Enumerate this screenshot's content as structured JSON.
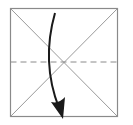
{
  "diagram": {
    "type": "origami-fold-step",
    "square": {
      "x": 10,
      "y": 8,
      "size": 108,
      "stroke": "#8a8a8a"
    },
    "creases": [
      {
        "name": "diagonal-tl-br",
        "from": [
          10,
          8
        ],
        "to": [
          118,
          116
        ]
      },
      {
        "name": "diagonal-tr-bl",
        "from": [
          118,
          8
        ],
        "to": [
          10,
          116
        ]
      }
    ],
    "fold_line": {
      "style": "dashed",
      "y": 62,
      "from_x": 10,
      "to_x": 118,
      "dash": "6 4",
      "stroke": "#8a8a8a"
    },
    "arrow": {
      "stroke": "#1a1a1a",
      "start": [
        55,
        13
      ],
      "control": [
        42,
        70
      ],
      "end": [
        62,
        118
      ]
    }
  }
}
